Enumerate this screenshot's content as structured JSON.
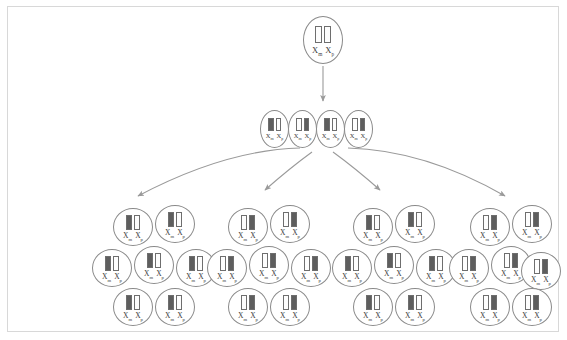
{
  "diagram": {
    "colors": {
      "cell_outline": "#8a8a8a",
      "arrow": "#9a9a9a",
      "bar_outline": "#6e6e6e",
      "bar_dark": "#5e5e5e",
      "bar_light": "#fdfdfd",
      "border": "#d8d8d8",
      "label_text": "#3a3a3a"
    },
    "label": {
      "maternal_symbol": "X",
      "maternal_sub": "m",
      "paternal_symbol": "X",
      "paternal_sub": "p"
    },
    "generation1": {
      "name": "zygote",
      "cells": [
        {
          "id": "g1-c1",
          "left": 303,
          "top": 16,
          "bars": [
            "light",
            "light"
          ],
          "label": "Xm Xp"
        }
      ]
    },
    "generation2": {
      "name": "early-embryo-row",
      "cells": [
        {
          "id": "g2-c1",
          "left": 260,
          "top": 110,
          "bars": [
            "dark",
            "light"
          ],
          "label": "Xm Xp"
        },
        {
          "id": "g2-c2",
          "left": 288,
          "top": 110,
          "bars": [
            "light",
            "dark"
          ],
          "label": "Xm Xp"
        },
        {
          "id": "g2-c3",
          "left": 316,
          "top": 110,
          "bars": [
            "dark",
            "light"
          ],
          "label": "Xm Xp"
        },
        {
          "id": "g2-c4",
          "left": 344,
          "top": 110,
          "bars": [
            "light",
            "dark"
          ],
          "label": "Xm Xp"
        }
      ]
    },
    "generation3": {
      "name": "clonal-patches",
      "clusters": [
        {
          "id": "cluster-1",
          "pattern": [
            "dark",
            "light"
          ],
          "cells": [
            {
              "id": "c1-n1",
              "left": 113,
              "top": 208,
              "label": "Xm Xp"
            },
            {
              "id": "c1-n2",
              "left": 155,
              "top": 205,
              "label": "Xm Xp"
            },
            {
              "id": "c1-n3",
              "left": 92,
              "top": 249,
              "label": "Xm Xp"
            },
            {
              "id": "c1-n4",
              "left": 134,
              "top": 246,
              "label": "Xm Xp"
            },
            {
              "id": "c1-n5",
              "left": 176,
              "top": 249,
              "label": "Xm Xp"
            },
            {
              "id": "c1-n6",
              "left": 113,
              "top": 288,
              "label": "Xm Xp"
            },
            {
              "id": "c1-n7",
              "left": 155,
              "top": 288,
              "label": "Xm Xp"
            }
          ]
        },
        {
          "id": "cluster-2",
          "pattern": [
            "light",
            "dark"
          ],
          "cells": [
            {
              "id": "c2-n1",
              "left": 228,
              "top": 208,
              "label": "Xm Xp"
            },
            {
              "id": "c2-n2",
              "left": 270,
              "top": 205,
              "label": "Xm Xp"
            },
            {
              "id": "c2-n3",
              "left": 207,
              "top": 249,
              "label": "Xm Xp"
            },
            {
              "id": "c2-n4",
              "left": 249,
              "top": 246,
              "label": "Xm Xp"
            },
            {
              "id": "c2-n5",
              "left": 291,
              "top": 249,
              "label": "Xm Xp"
            },
            {
              "id": "c2-n6",
              "left": 228,
              "top": 288,
              "label": "Xm Xp"
            },
            {
              "id": "c2-n7",
              "left": 270,
              "top": 288,
              "label": "Xm Xp"
            }
          ]
        },
        {
          "id": "cluster-3",
          "pattern": [
            "dark",
            "light"
          ],
          "cells": [
            {
              "id": "c3-n1",
              "left": 353,
              "top": 208,
              "label": "Xm Xp"
            },
            {
              "id": "c3-n2",
              "left": 395,
              "top": 205,
              "label": "Xm Xp"
            },
            {
              "id": "c3-n3",
              "left": 332,
              "top": 249,
              "label": "Xm Xp"
            },
            {
              "id": "c3-n4",
              "left": 374,
              "top": 246,
              "label": "Xm Xp"
            },
            {
              "id": "c3-n5",
              "left": 416,
              "top": 249,
              "label": "Xm Xp"
            },
            {
              "id": "c3-n6",
              "left": 353,
              "top": 288,
              "label": "Xm Xp"
            },
            {
              "id": "c3-n7",
              "left": 395,
              "top": 288,
              "label": "Xm Xp"
            }
          ]
        },
        {
          "id": "cluster-4",
          "pattern": [
            "light",
            "dark"
          ],
          "cells": [
            {
              "id": "c4-n1",
              "left": 470,
              "top": 208,
              "label": "Xm Xp"
            },
            {
              "id": "c4-n2",
              "left": 512,
              "top": 205,
              "label": "Xm Xp"
            },
            {
              "id": "c4-n3",
              "left": 449,
              "top": 249,
              "label": "Xm Xp"
            },
            {
              "id": "c4-n4",
              "left": 491,
              "top": 246,
              "label": "Xm Xp"
            },
            {
              "id": "c4-n5",
              "left": 521,
              "top": 252,
              "label": "Xm Xp"
            },
            {
              "id": "c4-n6",
              "left": 470,
              "top": 288,
              "label": "Xm Xp"
            },
            {
              "id": "c4-n7",
              "left": 512,
              "top": 288,
              "label": "Xm Xp"
            }
          ]
        }
      ]
    },
    "arrows": [
      {
        "id": "arrow-vertical",
        "kind": "straight",
        "d": "M323,66 L323,101"
      },
      {
        "id": "arrow-fan-left-outer",
        "kind": "curved",
        "d": "M300,148 Q225,150 138,196"
      },
      {
        "id": "arrow-fan-left-inner",
        "kind": "curved",
        "d": "M312,152 Q290,168 265,190"
      },
      {
        "id": "arrow-fan-right-inner",
        "kind": "curved",
        "d": "M333,152 Q355,168 380,190"
      },
      {
        "id": "arrow-fan-right-outer",
        "kind": "curved",
        "d": "M348,148 Q425,150 505,196"
      }
    ]
  }
}
